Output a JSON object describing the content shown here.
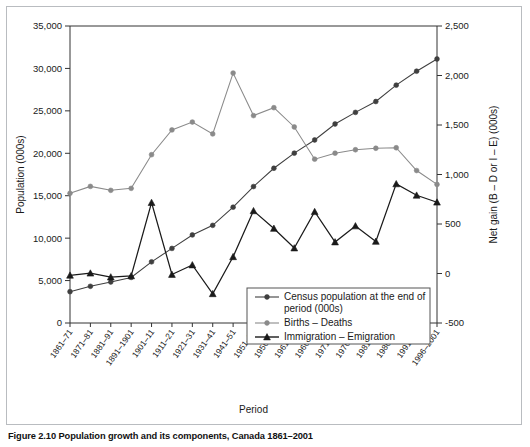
{
  "figure": {
    "caption_label": "Figure 2.10",
    "caption_text": "Population growth and its components, Canada 1861–2001"
  },
  "chart_data": {
    "type": "line",
    "title": "",
    "xlabel": "Period",
    "ylabel": "Population (000s)",
    "y2label": "Net gain (B – D or I – E) (000s)",
    "ylim": [
      0,
      35000
    ],
    "y2lim": [
      -500,
      2500
    ],
    "yticks": [
      "0",
      "5,000",
      "10,000",
      "15,000",
      "20,000",
      "25,000",
      "30,000",
      "35,000"
    ],
    "ytick_values": [
      0,
      5000,
      10000,
      15000,
      20000,
      25000,
      30000,
      35000
    ],
    "y2ticks": [
      "-500",
      "0",
      "500",
      "1,000",
      "1,500",
      "2,000",
      "2,500"
    ],
    "y2tick_values": [
      -500,
      0,
      500,
      1000,
      1500,
      2000,
      2500
    ],
    "grid": false,
    "legend_position": "lower-right-inside",
    "categories": [
      "1861–71",
      "1871–81",
      "1881–91",
      "1891–1901",
      "1901–11",
      "1911–21",
      "1921–31",
      "1931–41",
      "1941–51",
      "1951–56",
      "1956–61",
      "1961–66",
      "1966–71",
      "1971–76",
      "1976–81",
      "1981–86",
      "1986–91",
      "1991–96",
      "1996–2001"
    ],
    "series": [
      {
        "name": "Census population at the end of period (000s)",
        "axis": "left",
        "marker": "circle",
        "color": "#3f3f3f",
        "values": [
          3689,
          4325,
          4833,
          5371,
          7207,
          8788,
          10377,
          11507,
          13648,
          16081,
          18238,
          20015,
          21568,
          23450,
          24820,
          26101,
          28031,
          29672,
          31110
        ]
      },
      {
        "name": "Births – Deaths",
        "axis": "right",
        "marker": "circle",
        "color": "#8a8a8a",
        "values": [
          810,
          880,
          840,
          860,
          1200,
          1450,
          1530,
          1410,
          2025,
          1595,
          1675,
          1480,
          1155,
          1215,
          1250,
          1265,
          1270,
          1040,
          900
        ]
      },
      {
        "name": "Immigration – Emigration",
        "axis": "right",
        "marker": "triangle",
        "color": "#1a1a1a",
        "values": [
          -18,
          3,
          -36,
          -24,
          716,
          -10,
          86,
          -205,
          169,
          633,
          455,
          257,
          624,
          318,
          480,
          324,
          905,
          790,
          720
        ]
      }
    ],
    "legend": [
      {
        "label_line1": "Census population at the end of",
        "label_line2": "period (000s)",
        "marker": "circle",
        "color": "#3f3f3f"
      },
      {
        "label_line1": "Births – Deaths",
        "label_line2": "",
        "marker": "circle",
        "color": "#8a8a8a"
      },
      {
        "label_line1": "Immigration – Emigration",
        "label_line2": "",
        "marker": "triangle",
        "color": "#1a1a1a"
      }
    ]
  }
}
